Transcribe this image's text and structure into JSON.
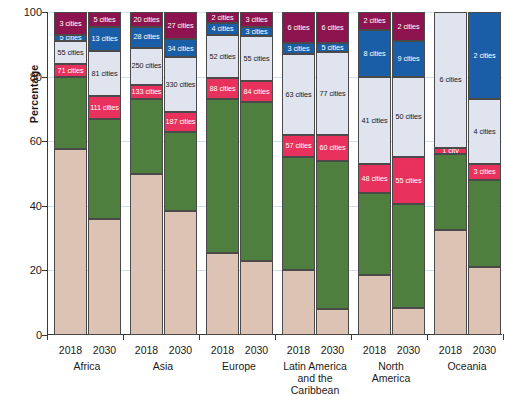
{
  "chart_data": {
    "type": "bar",
    "subtype": "stacked-percentage",
    "title": "",
    "xlabel": "",
    "ylabel": "Percentage",
    "ylim": [
      0,
      100
    ],
    "yticks": [
      0,
      20,
      40,
      60,
      80,
      100
    ],
    "grid": true,
    "legend_position": "none",
    "categories": [
      "Africa 2018",
      "Africa 2030",
      "Asia 2018",
      "Asia 2030",
      "Europe 2018",
      "Europe 2030",
      "Latin America and the Caribbean 2018",
      "Latin America and the Caribbean 2030",
      "North America 2018",
      "North America 2030",
      "Oceania 2018",
      "Oceania 2030"
    ],
    "regions": [
      {
        "name": "Africa",
        "years": [
          "2018",
          "2030"
        ]
      },
      {
        "name": "Asia",
        "years": [
          "2018",
          "2030"
        ]
      },
      {
        "name": "Europe",
        "years": [
          "2018",
          "2030"
        ]
      },
      {
        "name": "Latin America\nand the Caribbean",
        "years": [
          "2018",
          "2030"
        ]
      },
      {
        "name": "North\nAmerica",
        "years": [
          "2018",
          "2030"
        ]
      },
      {
        "name": "Oceania",
        "years": [
          "2018",
          "2030"
        ]
      }
    ],
    "series": [
      {
        "name": "class-1-beige",
        "color": "#ddc3b4",
        "values": [
          57.5,
          36.0,
          50.0,
          38.5,
          25.5,
          23.0,
          20.0,
          8.0,
          18.5,
          8.5,
          32.5,
          21.0
        ]
      },
      {
        "name": "class-2-green",
        "color": "#4f7f3f",
        "values": [
          22.5,
          31.0,
          23.0,
          24.5,
          47.5,
          49.0,
          35.0,
          46.0,
          25.5,
          32.0,
          23.5,
          27.0
        ]
      },
      {
        "name": "class-3-red",
        "color": "#e8315c",
        "values": [
          4.0,
          7.0,
          4.5,
          6.0,
          6.5,
          6.5,
          7.0,
          8.0,
          9.0,
          14.5,
          2.0,
          5.0
        ]
      },
      {
        "name": "class-4-lightgrey",
        "color": "#dfe4ee",
        "values": [
          7.0,
          14.0,
          11.5,
          17.0,
          13.5,
          14.0,
          25.0,
          25.5,
          27.0,
          25.0,
          42.0,
          20.0
        ]
      },
      {
        "name": "class-5-blue",
        "color": "#1b5ea8",
        "values": [
          2.0,
          7.5,
          6.5,
          5.5,
          3.5,
          3.0,
          3.5,
          3.0,
          14.5,
          11.0,
          0.0,
          27.0
        ]
      },
      {
        "name": "class-6-purple",
        "color": "#8e1450",
        "values": [
          7.0,
          4.5,
          4.5,
          8.5,
          3.5,
          4.5,
          9.5,
          9.5,
          5.5,
          9.0,
          0.0,
          0.0
        ]
      }
    ],
    "bar_labels": [
      {
        "bar": "Africa 2018",
        "labels": {
          "class-3-red": "71 cities",
          "class-4-lightgrey": "55 cities",
          "class-5-blue": "5 cities",
          "class-6-purple": "3 cities"
        }
      },
      {
        "bar": "Africa 2030",
        "labels": {
          "class-3-red": "111 cities",
          "class-4-lightgrey": "81 cities",
          "class-5-blue": "13 cities",
          "class-6-purple": "5 cities"
        }
      },
      {
        "bar": "Asia 2018",
        "labels": {
          "class-3-red": "133 cities",
          "class-4-lightgrey": "250 cities",
          "class-5-blue": "28 cities",
          "class-6-purple": "20 cities"
        }
      },
      {
        "bar": "Asia 2030",
        "labels": {
          "class-3-red": "187 cities",
          "class-4-lightgrey": "330 cities",
          "class-5-blue": "34 cities",
          "class-6-purple": "27 cities"
        }
      },
      {
        "bar": "Europe 2018",
        "labels": {
          "class-3-red": "88 cities",
          "class-4-lightgrey": "52 cities",
          "class-5-blue": "4 cities",
          "class-6-purple": "2 cities"
        }
      },
      {
        "bar": "Europe 2030",
        "labels": {
          "class-3-red": "84 cities",
          "class-4-lightgrey": "55 cities",
          "class-5-blue": "3 cities",
          "class-6-purple": "3 cities"
        }
      },
      {
        "bar": "Latin America and the Caribbean 2018",
        "labels": {
          "class-3-red": "57 cities",
          "class-4-lightgrey": "63 cities",
          "class-5-blue": "3 cities",
          "class-6-purple": "6 cities"
        }
      },
      {
        "bar": "Latin America and the Caribbean 2030",
        "labels": {
          "class-3-red": "60 cities",
          "class-4-lightgrey": "77 cities",
          "class-5-blue": "5 cities",
          "class-6-purple": "6 cities"
        }
      },
      {
        "bar": "North America 2018",
        "labels": {
          "class-3-red": "48 cities",
          "class-4-lightgrey": "41 cities",
          "class-5-blue": "8 cities",
          "class-6-purple": "2 cities"
        }
      },
      {
        "bar": "North America 2030",
        "labels": {
          "class-3-red": "55 cities",
          "class-4-lightgrey": "50 cities",
          "class-5-blue": "9 cities",
          "class-6-purple": "2 cities"
        }
      },
      {
        "bar": "Oceania 2018",
        "labels": {
          "class-3-red": "1 city",
          "class-4-lightgrey": "6 cities"
        }
      },
      {
        "bar": "Oceania 2030",
        "labels": {
          "class-3-red": "3 cities",
          "class-4-lightgrey": "4 cities",
          "class-5-blue": "2 cities"
        }
      }
    ]
  }
}
